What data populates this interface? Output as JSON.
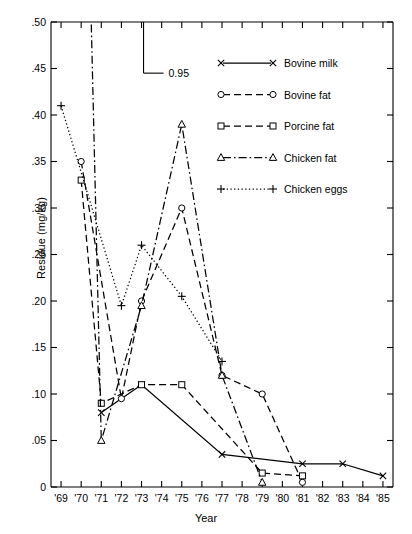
{
  "chart_data": {
    "type": "line",
    "title": "",
    "xlabel": "Year",
    "ylabel": "Residue (mg/kg)",
    "xlim": [
      68.5,
      85.5
    ],
    "ylim": [
      0,
      0.5
    ],
    "grid": false,
    "legend_position": "upper-right",
    "x_tick_labels": [
      "'69",
      "'70",
      "'71",
      "'72",
      "'73",
      "'74",
      "'75",
      "'76",
      "'77",
      "'78",
      "'79",
      "'80",
      "'81",
      "'82",
      "'83",
      "'84",
      "'85"
    ],
    "x_tick_values": [
      69,
      70,
      71,
      72,
      73,
      74,
      75,
      76,
      77,
      78,
      79,
      80,
      81,
      82,
      83,
      84,
      85
    ],
    "y_tick_labels": [
      "0",
      ".05",
      ".10",
      ".15",
      ".20",
      ".25",
      ".30",
      ".35",
      ".40",
      ".45",
      ".50"
    ],
    "y_tick_values": [
      0,
      0.05,
      0.1,
      0.15,
      0.2,
      0.25,
      0.3,
      0.35,
      0.4,
      0.45,
      0.5
    ],
    "annotation": {
      "label": "0.95",
      "y_value": 0.95,
      "bracket_top": 0.5,
      "bracket_bottom": 0.445,
      "x_value": 73.1
    },
    "series": [
      {
        "name": "Bovine milk",
        "marker": "x",
        "dash": "solid",
        "x": [
          71,
          73,
          77,
          81,
          83,
          85
        ],
        "y": [
          0.08,
          0.11,
          0.035,
          0.025,
          0.025,
          0.012
        ]
      },
      {
        "name": "Bovine fat",
        "marker": "o",
        "dash": "dashed",
        "x": [
          70,
          72,
          73,
          75,
          77,
          79,
          81
        ],
        "y": [
          0.35,
          0.095,
          0.2,
          0.3,
          0.12,
          0.1,
          0.005
        ]
      },
      {
        "name": "Porcine fat",
        "marker": "s",
        "dash": "dashed",
        "x": [
          70,
          71,
          73,
          75,
          79,
          81
        ],
        "y": [
          0.33,
          0.09,
          0.11,
          0.11,
          0.015,
          0.012
        ]
      },
      {
        "name": "Chicken fat",
        "marker": "tri",
        "dash": "dashdot",
        "x": [
          70,
          71,
          73,
          75,
          77,
          79
        ],
        "y": [
          0.95,
          0.05,
          0.195,
          0.39,
          0.12,
          0.005
        ]
      },
      {
        "name": "Chicken eggs",
        "marker": "plus",
        "dash": "dotted",
        "x": [
          69,
          72,
          73,
          75,
          77
        ],
        "y": [
          0.41,
          0.195,
          0.26,
          0.205,
          0.135
        ]
      }
    ]
  },
  "legend": {
    "entries": [
      {
        "label": "Bovine milk"
      },
      {
        "label": "Bovine fat"
      },
      {
        "label": "Porcine fat"
      },
      {
        "label": "Chicken fat"
      },
      {
        "label": "Chicken eggs"
      }
    ]
  }
}
